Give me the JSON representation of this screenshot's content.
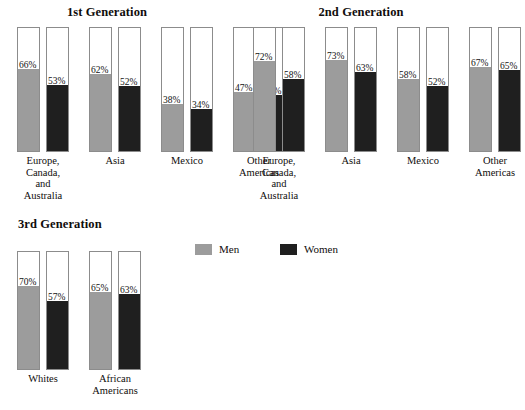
{
  "chart_data": {
    "type": "bar",
    "title": "",
    "subtitle": "",
    "xlabel": "",
    "ylabel": "",
    "ylim": [
      0,
      100
    ],
    "grid": false,
    "legend_position": "center",
    "units": "percent",
    "legend": [
      {
        "name": "Men",
        "color": "#9c9c9c",
        "swatch": "men"
      },
      {
        "name": "Women",
        "color": "#1f1f1f",
        "swatch": "women"
      }
    ],
    "panels": [
      {
        "title": "1st Generation",
        "categories": [
          "Europe,\nCanada,\nand\nAustralia",
          "Asia",
          "Mexico",
          "Other\nAmericas"
        ],
        "series": [
          {
            "name": "Men",
            "values": [
              66,
              62,
              38,
              47
            ],
            "labels": [
              "66%",
              "62%",
              "38%",
              "47%"
            ]
          },
          {
            "name": "Women",
            "values": [
              53,
              52,
              34,
              45
            ],
            "labels": [
              "53%",
              "52%",
              "34%",
              "45%"
            ]
          }
        ]
      },
      {
        "title": "2nd Generation",
        "categories": [
          "Europe,\nCanada,\nand\nAustralia",
          "Asia",
          "Mexico",
          "Other\nAmericas"
        ],
        "series": [
          {
            "name": "Men",
            "values": [
              72,
              73,
              58,
              67
            ],
            "labels": [
              "72%",
              "73%",
              "58%",
              "67%"
            ]
          },
          {
            "name": "Women",
            "values": [
              58,
              63,
              52,
              65
            ],
            "labels": [
              "58%",
              "63%",
              "52%",
              "65%"
            ]
          }
        ]
      },
      {
        "title": "3rd Generation",
        "categories": [
          "Whites",
          "African\nAmericans"
        ],
        "series": [
          {
            "name": "Men",
            "values": [
              70,
              65
            ],
            "labels": [
              "70%",
              "65%"
            ]
          },
          {
            "name": "Women",
            "values": [
              57,
              63
            ],
            "labels": [
              "57%",
              "63%"
            ]
          }
        ]
      }
    ]
  },
  "panel1": {
    "title": "1st Generation",
    "bars": [
      {
        "label": "66%",
        "fill": 66,
        "kind": "men"
      },
      {
        "label": "53%",
        "fill": 53,
        "kind": "women"
      },
      {
        "label": "62%",
        "fill": 62,
        "kind": "men"
      },
      {
        "label": "52%",
        "fill": 52,
        "kind": "women"
      },
      {
        "label": "38%",
        "fill": 38,
        "kind": "men"
      },
      {
        "label": "34%",
        "fill": 34,
        "kind": "women"
      },
      {
        "label": "47%",
        "fill": 47,
        "kind": "men"
      },
      {
        "label": "45%",
        "fill": 45,
        "kind": "women"
      }
    ],
    "cats": [
      "Europe,\nCanada,\nand\nAustralia",
      "Asia",
      "Mexico",
      "Other\nAmericas"
    ]
  },
  "panel2": {
    "title": "2nd Generation",
    "bars": [
      {
        "label": "72%",
        "fill": 72,
        "kind": "men"
      },
      {
        "label": "58%",
        "fill": 58,
        "kind": "women"
      },
      {
        "label": "73%",
        "fill": 73,
        "kind": "men"
      },
      {
        "label": "63%",
        "fill": 63,
        "kind": "women"
      },
      {
        "label": "58%",
        "fill": 58,
        "kind": "men"
      },
      {
        "label": "52%",
        "fill": 52,
        "kind": "women"
      },
      {
        "label": "67%",
        "fill": 67,
        "kind": "men"
      },
      {
        "label": "65%",
        "fill": 65,
        "kind": "women"
      }
    ],
    "cats": [
      "Europe,\nCanada,\nand\nAustralia",
      "Asia",
      "Mexico",
      "Other\nAmericas"
    ]
  },
  "panel3": {
    "title": "3rd Generation",
    "bars": [
      {
        "label": "70%",
        "fill": 70,
        "kind": "men"
      },
      {
        "label": "57%",
        "fill": 57,
        "kind": "women"
      },
      {
        "label": "65%",
        "fill": 65,
        "kind": "men"
      },
      {
        "label": "63%",
        "fill": 63,
        "kind": "women"
      }
    ],
    "cats": [
      "Whites",
      "African\nAmericans"
    ]
  },
  "legend": {
    "men": "Men",
    "women": "Women"
  }
}
